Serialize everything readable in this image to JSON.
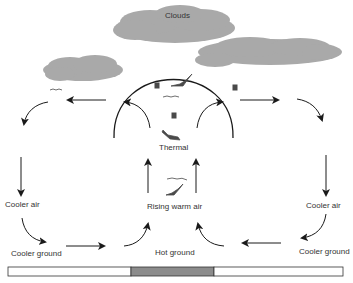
{
  "diagram": {
    "labels": {
      "clouds": "Clouds",
      "thermal": "Thermal",
      "rising_warm_air": "Rising warm air",
      "hot_ground": "Hot ground",
      "cooler_air_left": "Cooler air",
      "cooler_air_right": "Cooler air",
      "cooler_ground_left": "Cooler ground",
      "cooler_ground_right": "Cooler ground"
    },
    "colors": {
      "cloud": "#a9a9a9",
      "hot_ground": "#8c8c8c",
      "cooler_ground": "#ffffff",
      "line": "#1a1a1a",
      "text": "#333333"
    }
  }
}
